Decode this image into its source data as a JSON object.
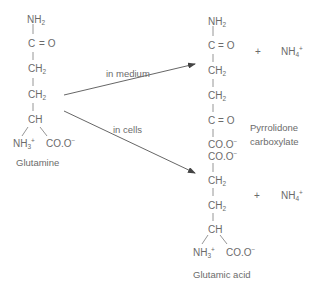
{
  "diagram": {
    "type": "reaction-scheme",
    "reactant": {
      "name": "Glutamine",
      "groups": [
        "NH2",
        "C=O",
        "CH2",
        "CH2",
        "CH",
        "NH3+",
        "COO-"
      ]
    },
    "arrows": [
      {
        "label": "in medium",
        "to": "Pyrrolidone carboxylate"
      },
      {
        "label": "in cells",
        "to": "Glutamic acid"
      }
    ],
    "product_1": {
      "name_line1": "Pyrrolidone",
      "name_line2": "carboxylate",
      "groups": [
        "NH2",
        "C=O",
        "CH2",
        "CH2",
        "C=O",
        "COO-"
      ],
      "coproduct": "NH4+",
      "plus": "+"
    },
    "product_2": {
      "name": "Glutamic acid",
      "groups": [
        "COO-",
        "CH2",
        "CH2",
        "CH",
        "NH3+",
        "COO-"
      ],
      "coproduct": "NH4+",
      "plus": "+"
    }
  },
  "text": {
    "nh2_main": "NH",
    "sub2": "2",
    "sub3": "3",
    "sub4": "4",
    "co_C": "C",
    "co_eq": "=",
    "co_O": "O",
    "ch2_main": "CH",
    "ch": "CH",
    "nh3_main": "NH",
    "plus_sup": "+",
    "minus_sup": "−",
    "coo_main": "CO.O",
    "plus": "+",
    "nh4_main": "NH",
    "glutamine": "Glutamine",
    "in_medium": "in medium",
    "in_cells": "in cells",
    "pyrrolidone": "Pyrrolidone",
    "carboxylate": "carboxylate",
    "glutamic_acid": "Glutamic acid"
  },
  "colors": {
    "ink": "#6b6b6b",
    "arrow": "#555555",
    "background": "#ffffff"
  }
}
